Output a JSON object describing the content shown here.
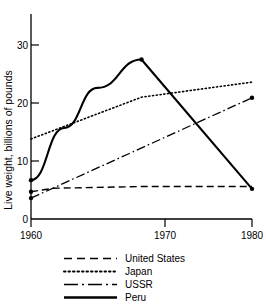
{
  "chart_data": {
    "type": "line",
    "title": "",
    "xlabel": "",
    "ylabel": "Live weight, billions of pounds",
    "xlim": [
      1960,
      1980
    ],
    "ylim": [
      0,
      33
    ],
    "xticks": [
      1960,
      1970,
      1980
    ],
    "xtick_labels": [
      "1960",
      "1970",
      "1980"
    ],
    "yticks": [
      0,
      10,
      20,
      30
    ],
    "ytick_labels": [
      "0",
      "10",
      "20",
      "30"
    ],
    "grid": false,
    "legend_position": "below",
    "series": [
      {
        "name": "United States",
        "style": "dashed",
        "color": "#000000",
        "x": [
          1960,
          1962,
          1970,
          1980
        ],
        "y": [
          4.7,
          5.3,
          5.6,
          5.6
        ]
      },
      {
        "name": "Japan",
        "style": "dotted",
        "color": "#000000",
        "x": [
          1960,
          1970,
          1980
        ],
        "y": [
          13.8,
          21.0,
          23.6
        ]
      },
      {
        "name": "USSR",
        "style": "dash-dot",
        "color": "#000000",
        "x": [
          1960,
          1980
        ],
        "y": [
          3.6,
          20.9
        ]
      },
      {
        "name": "Peru",
        "style": "solid",
        "color": "#000000",
        "x": [
          1960,
          1963,
          1966,
          1970,
          1980
        ],
        "y": [
          6.7,
          15.7,
          22.6,
          27.5,
          5.2
        ]
      }
    ],
    "markers": [
      {
        "series": "Peru",
        "x": 1960,
        "y": 6.7
      },
      {
        "series": "United States",
        "x": 1960,
        "y": 4.7
      },
      {
        "series": "USSR",
        "x": 1960,
        "y": 3.6
      },
      {
        "series": "Peru",
        "x": 1970,
        "y": 27.5
      },
      {
        "series": "USSR",
        "x": 1980,
        "y": 20.9
      },
      {
        "series": "Peru",
        "x": 1980,
        "y": 5.2
      }
    ]
  },
  "legend": {
    "entries": [
      {
        "label": "United States",
        "style": "dashed"
      },
      {
        "label": "Japan",
        "style": "dotted"
      },
      {
        "label": "USSR",
        "style": "dash-dot"
      },
      {
        "label": "Peru",
        "style": "solid"
      }
    ]
  }
}
